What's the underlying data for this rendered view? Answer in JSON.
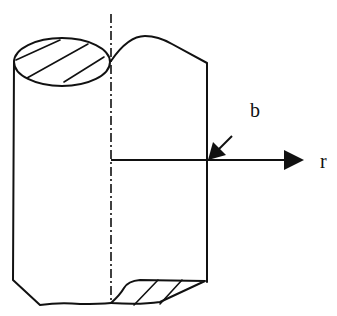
{
  "diagram": {
    "labels": {
      "radius": "b",
      "radial_axis": "r"
    },
    "colors": {
      "stroke": "#111111",
      "background": "#ffffff"
    }
  }
}
